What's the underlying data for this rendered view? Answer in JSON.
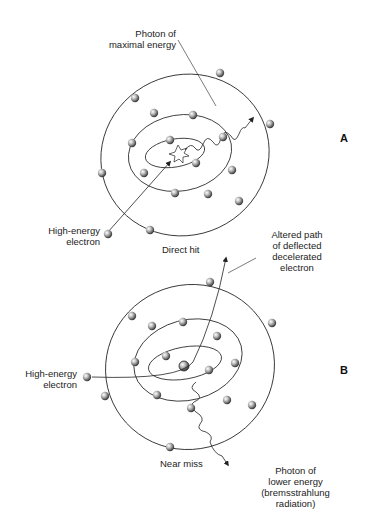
{
  "panel_a": {
    "letter": "A",
    "photon_label_1": "Photon of",
    "photon_label_2": "maximal energy",
    "electron_label_1": "High-energy",
    "electron_label_2": "electron",
    "caption": "Direct hit"
  },
  "panel_b": {
    "letter": "B",
    "altered_label_1": "Altered path",
    "altered_label_2": "of deflected",
    "altered_label_3": "decelerated",
    "altered_label_4": "electron",
    "electron_label_1": "High-energy",
    "electron_label_2": "electron",
    "caption": "Near miss",
    "photon_label_1": "Photon of",
    "photon_label_2": "lower energy",
    "photon_label_3": "(bremsstrahlung",
    "photon_label_4": "radiation)"
  },
  "colors": {
    "line": "#222222",
    "electron_fill": "#9a9a9a"
  }
}
